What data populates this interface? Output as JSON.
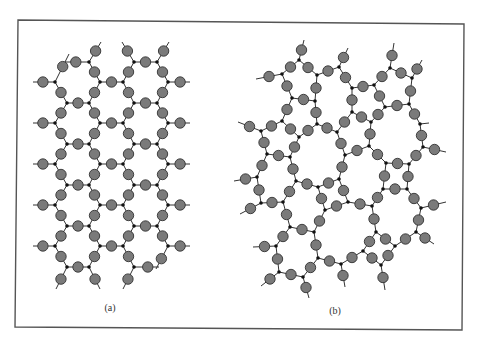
{
  "figure": {
    "frame": {
      "points": [
        [
          18,
          20
        ],
        [
          464,
          24
        ],
        [
          462,
          330
        ],
        [
          15,
          327
        ]
      ],
      "stroke": "#555555"
    },
    "atom_color": "#7a7a7a",
    "node_color": "#111111",
    "atom_radius": 5.2,
    "node_radius": 1.8
  },
  "panels": [
    {
      "id": "a",
      "caption": "(a)",
      "caption_pos": [
        110,
        311
      ],
      "type": "crystalline",
      "lattice": {
        "cols": {
          "A": 55,
          "B": 67,
          "C": 89,
          "D": 100,
          "E": 123,
          "F": 134,
          "G": 157,
          "H": 168
        },
        "even_rows": [
          62,
          103,
          144,
          185,
          226,
          267
        ],
        "odd_rows": [
          82,
          123,
          164,
          205,
          246
        ]
      }
    },
    {
      "id": "b",
      "caption": "(b)",
      "caption_pos": [
        335,
        314
      ],
      "type": "amorphous",
      "nodes": [
        [
          299,
          60
        ],
        [
          282,
          74
        ],
        [
          317,
          75
        ],
        [
          339,
          67
        ],
        [
          292,
          98
        ],
        [
          315,
          101
        ],
        [
          352,
          88
        ],
        [
          352,
          112
        ],
        [
          282,
          121
        ],
        [
          261,
          131
        ],
        [
          317,
          124
        ],
        [
          337,
          132
        ],
        [
          299,
          137
        ],
        [
          390,
          68
        ],
        [
          412,
          78
        ],
        [
          374,
          85
        ],
        [
          385,
          107
        ],
        [
          409,
          104
        ],
        [
          371,
          122
        ],
        [
          420,
          124
        ],
        [
          267,
          154
        ],
        [
          290,
          157
        ],
        [
          345,
          155
        ],
        [
          257,
          177
        ],
        [
          296,
          181
        ],
        [
          318,
          187
        ],
        [
          339,
          179
        ],
        [
          261,
          203
        ],
        [
          283,
          202
        ],
        [
          325,
          210
        ],
        [
          348,
          202
        ],
        [
          369,
          146
        ],
        [
          386,
          163
        ],
        [
          409,
          164
        ],
        [
          423,
          147
        ],
        [
          383,
          189
        ],
        [
          407,
          189
        ],
        [
          372,
          206
        ],
        [
          421,
          208
        ],
        [
          290,
          227
        ],
        [
          314,
          232
        ],
        [
          276,
          246
        ],
        [
          318,
          258
        ],
        [
          341,
          264
        ],
        [
          279,
          272
        ],
        [
          303,
          277
        ],
        [
          376,
          232
        ],
        [
          416,
          232
        ],
        [
          363,
          251
        ],
        [
          395,
          246
        ],
        [
          381,
          265
        ]
      ],
      "edges": [
        [
          0,
          1
        ],
        [
          0,
          2
        ],
        [
          1,
          4
        ],
        [
          2,
          3
        ],
        [
          2,
          5
        ],
        [
          3,
          6
        ],
        [
          4,
          5
        ],
        [
          4,
          8
        ],
        [
          5,
          10
        ],
        [
          6,
          15
        ],
        [
          6,
          7
        ],
        [
          7,
          11
        ],
        [
          7,
          18
        ],
        [
          8,
          9
        ],
        [
          8,
          12
        ],
        [
          9,
          20
        ],
        [
          10,
          11
        ],
        [
          10,
          12
        ],
        [
          12,
          21
        ],
        [
          11,
          22
        ],
        [
          13,
          15
        ],
        [
          13,
          14
        ],
        [
          14,
          17
        ],
        [
          15,
          16
        ],
        [
          16,
          17
        ],
        [
          16,
          18
        ],
        [
          17,
          19
        ],
        [
          18,
          31
        ],
        [
          19,
          34
        ],
        [
          20,
          21
        ],
        [
          20,
          23
        ],
        [
          21,
          24
        ],
        [
          22,
          26
        ],
        [
          22,
          31
        ],
        [
          24,
          25
        ],
        [
          24,
          28
        ],
        [
          23,
          27
        ],
        [
          25,
          26
        ],
        [
          25,
          29
        ],
        [
          26,
          30
        ],
        [
          27,
          28
        ],
        [
          28,
          39
        ],
        [
          29,
          30
        ],
        [
          29,
          40
        ],
        [
          31,
          32
        ],
        [
          32,
          33
        ],
        [
          32,
          35
        ],
        [
          33,
          34
        ],
        [
          33,
          36
        ],
        [
          35,
          36
        ],
        [
          35,
          37
        ],
        [
          30,
          37
        ],
        [
          36,
          38
        ],
        [
          37,
          46
        ],
        [
          38,
          47
        ],
        [
          39,
          40
        ],
        [
          39,
          41
        ],
        [
          40,
          42
        ],
        [
          41,
          44
        ],
        [
          42,
          43
        ],
        [
          42,
          45
        ],
        [
          44,
          45
        ],
        [
          43,
          48
        ],
        [
          46,
          48
        ],
        [
          46,
          49
        ],
        [
          47,
          49
        ],
        [
          48,
          50
        ],
        [
          49,
          50
        ]
      ],
      "dangles": [
        {
          "node": 0,
          "to": [
            304,
            40
          ],
          "atom": true
        },
        {
          "node": 1,
          "to": [
            256,
            79
          ],
          "atom": true
        },
        {
          "node": 3,
          "to": [
            348,
            48
          ],
          "atom": true
        },
        {
          "node": 9,
          "to": [
            238,
            122
          ],
          "atom": true
        },
        {
          "node": 13,
          "to": [
            394,
            43
          ],
          "atom": true
        },
        {
          "node": 14,
          "to": [
            422,
            60
          ],
          "atom": true
        },
        {
          "node": 19,
          "to": [
            429,
            123
          ],
          "atom": false
        },
        {
          "node": 34,
          "to": [
            446,
            152
          ],
          "atom": true
        },
        {
          "node": 23,
          "to": [
            234,
            181
          ],
          "atom": true
        },
        {
          "node": 27,
          "to": [
            240,
            214
          ],
          "atom": true
        },
        {
          "node": 38,
          "to": [
            446,
            202
          ],
          "atom": true
        },
        {
          "node": 41,
          "to": [
            253,
            247
          ],
          "atom": true
        },
        {
          "node": 44,
          "to": [
            261,
            286
          ],
          "atom": true
        },
        {
          "node": 45,
          "to": [
            309,
            298
          ],
          "atom": true
        },
        {
          "node": 43,
          "to": [
            345,
            287
          ],
          "atom": true
        },
        {
          "node": 47,
          "to": [
            434,
            244
          ],
          "atom": true
        },
        {
          "node": 50,
          "to": [
            385,
            290
          ],
          "atom": true
        }
      ]
    }
  ]
}
